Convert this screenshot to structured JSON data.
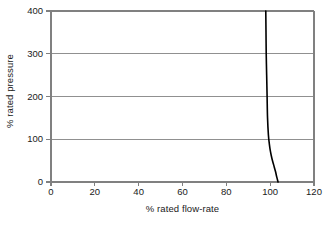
{
  "chart_data": {
    "type": "line",
    "title": "",
    "subtitle": "",
    "xlabel": "% rated flow-rate",
    "ylabel": "% rated pressure",
    "xlim": [
      0,
      120
    ],
    "ylim": [
      0,
      400
    ],
    "xticks": [
      0,
      20,
      40,
      60,
      80,
      100,
      120
    ],
    "yticks": [
      0,
      100,
      200,
      300,
      400
    ],
    "xtick_labels": [
      "0",
      "20",
      "40",
      "60",
      "80",
      "100",
      "120"
    ],
    "ytick_labels": [
      "0",
      "100",
      "200",
      "300",
      "400"
    ],
    "grid": {
      "horizontal": true,
      "vertical": false,
      "color": "#808080"
    },
    "legend": {
      "visible": false,
      "position": "none",
      "entries": []
    },
    "annotations": [],
    "series": [
      {
        "name": "characteristic curve",
        "color": "#000000",
        "line_width": 1.6,
        "markers": false,
        "comment": "x = % rated flow-rate, y = % rated pressure",
        "points": [
          {
            "x": 98.0,
            "y": 400
          },
          {
            "x": 98.1,
            "y": 350
          },
          {
            "x": 98.2,
            "y": 300
          },
          {
            "x": 98.4,
            "y": 250
          },
          {
            "x": 98.6,
            "y": 200
          },
          {
            "x": 98.8,
            "y": 150
          },
          {
            "x": 99.2,
            "y": 110
          },
          {
            "x": 99.6,
            "y": 90
          },
          {
            "x": 100.1,
            "y": 72
          },
          {
            "x": 100.8,
            "y": 55
          },
          {
            "x": 101.6,
            "y": 40
          },
          {
            "x": 102.4,
            "y": 25
          },
          {
            "x": 103.0,
            "y": 12
          },
          {
            "x": 103.6,
            "y": 0
          }
        ]
      }
    ]
  },
  "axes": {
    "frame_color": "#808080",
    "tick_color": "#808080",
    "background": "#ffffff"
  }
}
